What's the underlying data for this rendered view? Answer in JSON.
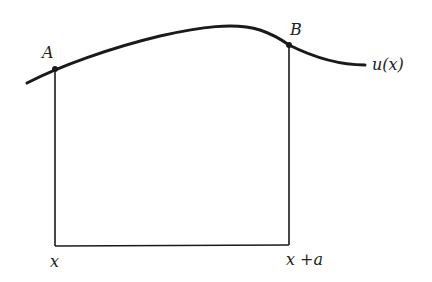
{
  "diagram": {
    "curve_label": "u(x)",
    "points": [
      {
        "label": "A",
        "x_label": "x"
      },
      {
        "label": "B",
        "x_label": "x +a"
      }
    ],
    "colors": {
      "stroke": "#1a1a1a",
      "background": "#ffffff"
    }
  }
}
